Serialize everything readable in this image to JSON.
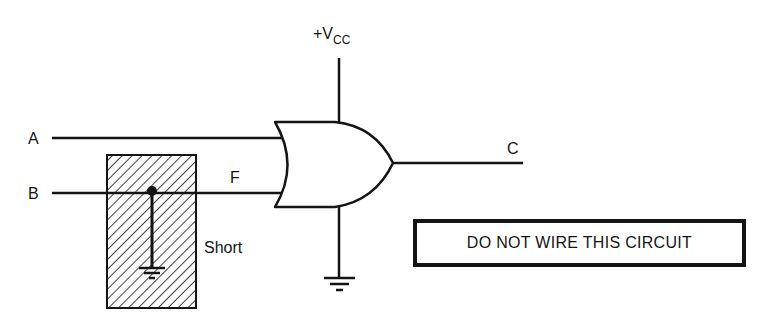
{
  "diagram": {
    "type": "logic-circuit-fault",
    "gate": {
      "type": "OR",
      "inputs": [
        "A",
        "F"
      ],
      "output": "C"
    },
    "labels": {
      "input_a": "A",
      "input_b": "B",
      "node_f": "F",
      "output_c": "C",
      "supply": "+V",
      "supply_sub": "CC",
      "short": "Short"
    },
    "fault": {
      "description": "Short to ground on line B",
      "node": "F"
    },
    "warning": "DO NOT WIRE THIS CIRCUIT"
  },
  "colors": {
    "ink": "#141414",
    "background": "#ffffff"
  }
}
